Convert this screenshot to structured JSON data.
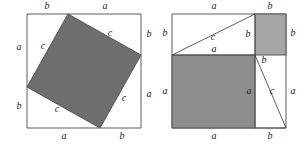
{
  "figure": {
    "canvas": {
      "width": 305,
      "height": 149
    },
    "colors": {
      "background": "#ffffff",
      "line": "#4a4a4a",
      "fill_dark": "#6e6e6e",
      "fill_light": "#a6a6a6",
      "text": "#1b1b1b"
    },
    "labels": {
      "a": "a",
      "b": "b",
      "c": "c"
    },
    "panels": [
      {
        "name": "left-panel",
        "description": "Outer square of side (a+b) containing a tilted square of side c and four right triangles",
        "outer_square": {
          "x": 27,
          "y": 14,
          "size": 114
        },
        "tilted_square_vertices": [
          {
            "x": 68,
            "y": 14
          },
          {
            "x": 141,
            "y": 55
          },
          {
            "x": 100,
            "y": 128
          },
          {
            "x": 27,
            "y": 87
          }
        ],
        "annotations": [
          {
            "id": "L-top-b",
            "text": "b",
            "x": 47,
            "y": 7
          },
          {
            "id": "L-top-a",
            "text": "a",
            "x": 105,
            "y": 7
          },
          {
            "id": "L-left-a",
            "text": "a",
            "x": 19,
            "y": 48
          },
          {
            "id": "L-left-b",
            "text": "b",
            "x": 19,
            "y": 107
          },
          {
            "id": "L-right-b",
            "text": "b",
            "x": 149,
            "y": 35
          },
          {
            "id": "L-right-a",
            "text": "a",
            "x": 149,
            "y": 95
          },
          {
            "id": "L-bot-a",
            "text": "a",
            "x": 64,
            "y": 137
          },
          {
            "id": "L-bot-b",
            "text": "b",
            "x": 122,
            "y": 137
          },
          {
            "id": "L-c-upper-left",
            "text": "c",
            "x": 43,
            "y": 47
          },
          {
            "id": "L-c-upper-right",
            "text": "c",
            "x": 110,
            "y": 34
          },
          {
            "id": "L-c-lower-right",
            "text": "c",
            "x": 124,
            "y": 99
          },
          {
            "id": "L-c-lower-left",
            "text": "c",
            "x": 57,
            "y": 110
          }
        ]
      },
      {
        "name": "right-panel",
        "description": "Outer square of side (a+b) partitioned into an a-square, a b-square and two right triangles",
        "outer_square": {
          "x": 172,
          "y": 14,
          "size": 114
        },
        "square_a": {
          "x": 172,
          "y": 55,
          "width": 83,
          "height": 73
        },
        "square_b": {
          "x": 255,
          "y": 14,
          "width": 31,
          "height": 41
        },
        "triangles": [
          {
            "id": "upper-triangle",
            "points": [
              {
                "x": 172,
                "y": 55
              },
              {
                "x": 255,
                "y": 14
              },
              {
                "x": 255,
                "y": 55
              }
            ]
          },
          {
            "id": "lower-triangle",
            "points": [
              {
                "x": 255,
                "y": 55
              },
              {
                "x": 286,
                "y": 128
              },
              {
                "x": 255,
                "y": 128
              }
            ]
          }
        ],
        "annotations": [
          {
            "id": "R-top-a",
            "text": "a",
            "x": 214,
            "y": 7
          },
          {
            "id": "R-top-b",
            "text": "b",
            "x": 270,
            "y": 7
          },
          {
            "id": "R-left-b",
            "text": "b",
            "x": 165,
            "y": 34
          },
          {
            "id": "R-left-a",
            "text": "a",
            "x": 165,
            "y": 92
          },
          {
            "id": "R-right-b",
            "text": "b",
            "x": 293,
            "y": 34
          },
          {
            "id": "R-right-a",
            "text": "a",
            "x": 293,
            "y": 92
          },
          {
            "id": "R-bot-a",
            "text": "a",
            "x": 214,
            "y": 137
          },
          {
            "id": "R-bot-b",
            "text": "b",
            "x": 270,
            "y": 137
          },
          {
            "id": "R-c-upper",
            "text": "c",
            "x": 213,
            "y": 38
          },
          {
            "id": "R-inner-b-1",
            "text": "b",
            "x": 248,
            "y": 35
          },
          {
            "id": "R-inner-a-1",
            "text": "a",
            "x": 214,
            "y": 50
          },
          {
            "id": "R-inner-b-2",
            "text": "b",
            "x": 264,
            "y": 61
          },
          {
            "id": "R-inner-a-2",
            "text": "a",
            "x": 249,
            "y": 92
          },
          {
            "id": "R-c-lower",
            "text": "c",
            "x": 272,
            "y": 92
          }
        ]
      }
    ]
  }
}
